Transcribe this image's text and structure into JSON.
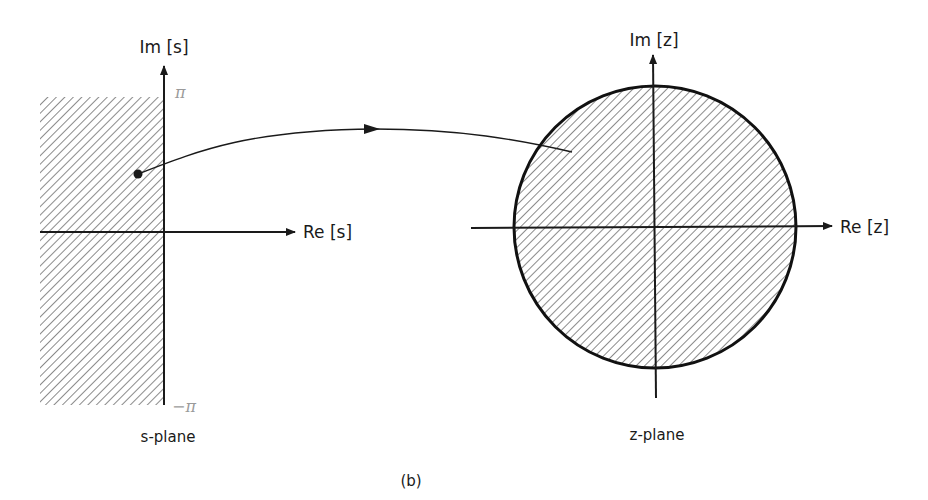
{
  "figure": {
    "caption": "(b)",
    "s_plane": {
      "name": "s-plane",
      "imag_axis_label": "Im [s]",
      "real_axis_label": "Re [s]",
      "upper_bound_label": "π",
      "lower_bound_label": "−π",
      "shaded_region": "left half-plane strip, −π ≤ Im[s] ≤ π"
    },
    "z_plane": {
      "name": "z-plane",
      "imag_axis_label": "Im [z]",
      "real_axis_label": "Re [z]",
      "shaded_region": "unit circle interior"
    },
    "mapping": {
      "description": "point in s-plane strip maps to point inside unit circle in z-plane"
    },
    "colors": {
      "ink": "#1a1a1a",
      "annotation": "#9a9a9a"
    }
  }
}
